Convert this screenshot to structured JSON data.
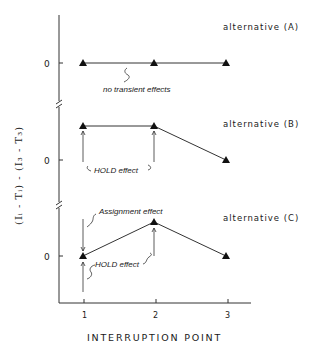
{
  "figure": {
    "x_axis": {
      "label": "INTERRUPTION POINT",
      "ticks": [
        "1",
        "2",
        "3"
      ]
    },
    "y_axis": {
      "label": "(Iᵢ - Tᵢ) - (I₃ - T₃)",
      "zero_label": "0"
    },
    "panels": [
      {
        "id": "A",
        "title": "alternative  (A)",
        "points": [
          {
            "x": 1,
            "y": 0
          },
          {
            "x": 2,
            "y": 0
          },
          {
            "x": 3,
            "y": 0
          }
        ],
        "annotations": [
          "no  transient  effects"
        ]
      },
      {
        "id": "B",
        "title": "alternative  (B)",
        "points": [
          {
            "x": 1,
            "y": 1
          },
          {
            "x": 2,
            "y": 1
          },
          {
            "x": 3,
            "y": 0
          }
        ],
        "annotations": [
          "HOLD  effect"
        ]
      },
      {
        "id": "C",
        "title": "alternative  (C)",
        "points": [
          {
            "x": 1,
            "y": 0
          },
          {
            "x": 2,
            "y": 1
          },
          {
            "x": 3,
            "y": 0
          }
        ],
        "annotations": [
          "Assignment  effect",
          "HOLD  effect"
        ]
      }
    ]
  }
}
